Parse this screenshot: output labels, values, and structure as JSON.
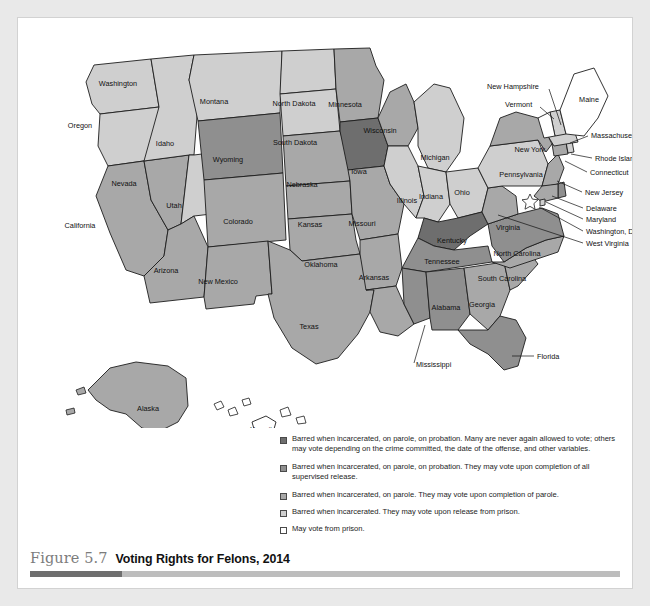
{
  "figure": {
    "number": "Figure 5.7",
    "title": "Voting Rights for Felons, 2014"
  },
  "colors": {
    "cat_darkest": "#6e6e6e",
    "cat_dark": "#8f8f8f",
    "cat_medium": "#a8a8a8",
    "cat_light": "#cfcfcf",
    "cat_white": "#ffffff",
    "outline": "#1d1d1d",
    "caption_number": "#7c7c7c",
    "caption_title": "#111111",
    "rule_dark": "#6e6e6e",
    "rule_light": "#bdbdbd",
    "page_background": "#e9e9e9",
    "card_background": "#ffffff"
  },
  "legend": {
    "items": [
      {
        "swatch": "#6e6e6e",
        "text": "Barred when incarcerated, on parole, on probation. Many are never again allowed to vote; others may vote depending on the crime committed, the date of the offense, and other variables."
      },
      {
        "swatch": "#8f8f8f",
        "text": "Barred when incarcerated, on parole, on probation. They may vote upon completion of all supervised release."
      },
      {
        "swatch": "#a8a8a8",
        "text": "Barred when incarcerated, on parole. They may vote upon completion of parole."
      },
      {
        "swatch": "#cfcfcf",
        "text": "Barred when incarcerated. They may vote upon release from prison."
      },
      {
        "swatch": "#ffffff",
        "text": "May vote from prison."
      }
    ]
  },
  "chart_data": {
    "type": "map",
    "title": "Voting Rights for Felons, 2014",
    "region": "United States",
    "legend_position": "bottom-right",
    "categories": [
      "Barred when incarcerated, on parole, on probation. Many are never again allowed to vote; others may vote depending on the crime committed, the date of the offense, and other variables.",
      "Barred when incarcerated, on parole, on probation. They may vote upon completion of all supervised release.",
      "Barred when incarcerated, on parole. They may vote upon completion of parole.",
      "Barred when incarcerated. They may vote upon release from prison.",
      "May vote from prison."
    ],
    "states": [
      {
        "name": "Washington",
        "category": 3
      },
      {
        "name": "Oregon",
        "category": 3
      },
      {
        "name": "California",
        "category": 2
      },
      {
        "name": "Nevada",
        "category": 2
      },
      {
        "name": "Idaho",
        "category": 3
      },
      {
        "name": "Montana",
        "category": 3
      },
      {
        "name": "Utah",
        "category": 3
      },
      {
        "name": "Wyoming",
        "category": 1
      },
      {
        "name": "Colorado",
        "category": 2
      },
      {
        "name": "Arizona",
        "category": 2
      },
      {
        "name": "New Mexico",
        "category": 2
      },
      {
        "name": "North Dakota",
        "category": 3
      },
      {
        "name": "South Dakota",
        "category": 3
      },
      {
        "name": "Nebraska",
        "category": 2
      },
      {
        "name": "Kansas",
        "category": 2
      },
      {
        "name": "Oklahoma",
        "category": 2
      },
      {
        "name": "Texas",
        "category": 2
      },
      {
        "name": "Minnesota",
        "category": 2
      },
      {
        "name": "Iowa",
        "category": 0
      },
      {
        "name": "Missouri",
        "category": 2
      },
      {
        "name": "Arkansas",
        "category": 2
      },
      {
        "name": "Louisiana",
        "category": 2
      },
      {
        "name": "Wisconsin",
        "category": 2
      },
      {
        "name": "Illinois",
        "category": 3
      },
      {
        "name": "Michigan",
        "category": 3
      },
      {
        "name": "Indiana",
        "category": 3
      },
      {
        "name": "Ohio",
        "category": 3
      },
      {
        "name": "Kentucky",
        "category": 0
      },
      {
        "name": "Tennessee",
        "category": 1
      },
      {
        "name": "Mississippi",
        "category": 1
      },
      {
        "name": "Alabama",
        "category": 1
      },
      {
        "name": "Georgia",
        "category": 2
      },
      {
        "name": "Florida",
        "category": 1
      },
      {
        "name": "South Carolina",
        "category": 2
      },
      {
        "name": "North Carolina",
        "category": 2
      },
      {
        "name": "Virginia",
        "category": 1
      },
      {
        "name": "West Virginia",
        "category": 2
      },
      {
        "name": "Pennsylvania",
        "category": 3
      },
      {
        "name": "New York",
        "category": 2
      },
      {
        "name": "New Jersey",
        "category": 2
      },
      {
        "name": "Delaware",
        "category": 1
      },
      {
        "name": "Maryland",
        "category": 2
      },
      {
        "name": "Washington, D.C.",
        "category": 3
      },
      {
        "name": "Connecticut",
        "category": 2
      },
      {
        "name": "Rhode Island",
        "category": 3
      },
      {
        "name": "Massachusetts",
        "category": 3
      },
      {
        "name": "New Hampshire",
        "category": 3
      },
      {
        "name": "Vermont",
        "category": 4
      },
      {
        "name": "Maine",
        "category": 4
      },
      {
        "name": "Alaska",
        "category": 2
      },
      {
        "name": "Hawaii",
        "category": 4
      }
    ]
  },
  "map_labels": {
    "inline": [
      {
        "name": "Washington",
        "x": 100,
        "y": 68
      },
      {
        "name": "Oregon",
        "x": 62,
        "y": 110
      },
      {
        "name": "Idaho",
        "x": 147,
        "y": 128
      },
      {
        "name": "Montana",
        "x": 196,
        "y": 86
      },
      {
        "name": "Nevada",
        "x": 106,
        "y": 168
      },
      {
        "name": "Utah",
        "x": 156,
        "y": 190
      },
      {
        "name": "California",
        "x": 62,
        "y": 210
      },
      {
        "name": "Wyoming",
        "x": 210,
        "y": 144
      },
      {
        "name": "Colorado",
        "x": 220,
        "y": 206
      },
      {
        "name": "Arizona",
        "x": 148,
        "y": 255
      },
      {
        "name": "New Mexico",
        "x": 200,
        "y": 266
      },
      {
        "name": "North Dakota",
        "x": 276,
        "y": 88
      },
      {
        "name": "South Dakota",
        "x": 277,
        "y": 127
      },
      {
        "name": "Nebraska",
        "x": 284,
        "y": 169
      },
      {
        "name": "Kansas",
        "x": 292,
        "y": 209
      },
      {
        "name": "Oklahoma",
        "x": 303,
        "y": 249
      },
      {
        "name": "Texas",
        "x": 291,
        "y": 311
      },
      {
        "name": "Minnesota",
        "x": 327,
        "y": 89
      },
      {
        "name": "Iowa",
        "x": 341,
        "y": 156
      },
      {
        "name": "Missouri",
        "x": 344,
        "y": 208
      },
      {
        "name": "Arkansas",
        "x": 356,
        "y": 262
      },
      {
        "name": "Wisconsin",
        "x": 362,
        "y": 115
      },
      {
        "name": "Illinois",
        "x": 389,
        "y": 185
      },
      {
        "name": "Michigan",
        "x": 417,
        "y": 142
      },
      {
        "name": "Indiana",
        "x": 413,
        "y": 181
      },
      {
        "name": "Ohio",
        "x": 444,
        "y": 177
      },
      {
        "name": "Kentucky",
        "x": 434,
        "y": 225
      },
      {
        "name": "Tennessee",
        "x": 424,
        "y": 246
      },
      {
        "name": "Alabama",
        "x": 428,
        "y": 292
      },
      {
        "name": "Georgia",
        "x": 464,
        "y": 289
      },
      {
        "name": "South Carolina",
        "x": 484,
        "y": 263
      },
      {
        "name": "North Carolina",
        "x": 499,
        "y": 238
      },
      {
        "name": "Virginia",
        "x": 490,
        "y": 212
      },
      {
        "name": "Pennsylvania",
        "x": 503,
        "y": 159
      },
      {
        "name": "New York",
        "x": 512,
        "y": 134
      },
      {
        "name": "Alaska",
        "x": 130,
        "y": 393
      },
      {
        "name": "Hawaii",
        "x": 243,
        "y": 414
      },
      {
        "name": "Maine",
        "x": 571,
        "y": 84
      }
    ],
    "leadered": [
      {
        "name": "New Hampshire",
        "x": 469,
        "y": 71,
        "anchor": "start",
        "x1": 531,
        "y1": 71,
        "x2": 543,
        "y2": 107
      },
      {
        "name": "Vermont",
        "x": 487,
        "y": 89,
        "anchor": "start",
        "x1": 522,
        "y1": 89,
        "x2": 536,
        "y2": 101
      },
      {
        "name": "Massachusetts",
        "x": 573,
        "y": 120,
        "anchor": "start",
        "x1": 570,
        "y1": 118,
        "x2": 552,
        "y2": 125
      },
      {
        "name": "Rhode Island",
        "x": 577,
        "y": 143,
        "anchor": "start",
        "x1": 574,
        "y1": 140,
        "x2": 553,
        "y2": 136
      },
      {
        "name": "Connecticut",
        "x": 572,
        "y": 157,
        "anchor": "start",
        "x1": 569,
        "y1": 154,
        "x2": 547,
        "y2": 143
      },
      {
        "name": "New Jersey",
        "x": 567,
        "y": 177,
        "anchor": "start",
        "x1": 564,
        "y1": 174,
        "x2": 539,
        "y2": 163
      },
      {
        "name": "Delaware",
        "x": 568,
        "y": 193,
        "anchor": "start",
        "x1": 565,
        "y1": 190,
        "x2": 534,
        "y2": 178
      },
      {
        "name": "Maryland",
        "x": 568,
        "y": 204,
        "anchor": "start",
        "x1": 565,
        "y1": 201,
        "x2": 528,
        "y2": 184
      },
      {
        "name": "Washington, D.C.",
        "x": 568,
        "y": 216,
        "anchor": "start",
        "x1": 565,
        "y1": 213,
        "x2": 521,
        "y2": 189
      },
      {
        "name": "West Virginia",
        "x": 568,
        "y": 228,
        "anchor": "start",
        "x1": 565,
        "y1": 225,
        "x2": 480,
        "y2": 197
      },
      {
        "name": "Mississippi",
        "x": 398,
        "y": 349,
        "anchor": "start",
        "x1": 396,
        "y1": 345,
        "x2": 407,
        "y2": 307
      },
      {
        "name": "Florida",
        "x": 519,
        "y": 341,
        "anchor": "start",
        "x1": 516,
        "y1": 338,
        "x2": 494,
        "y2": 338
      }
    ]
  }
}
